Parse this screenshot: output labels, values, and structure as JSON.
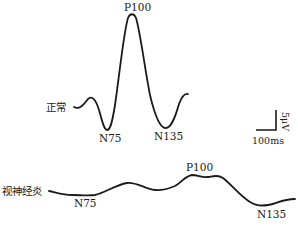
{
  "figure": {
    "type": "VEP waveform comparison",
    "traces": [
      {
        "name": "正常",
        "peaks": [
          {
            "label": "N75",
            "polarity": "negative"
          },
          {
            "label": "P100",
            "polarity": "positive"
          },
          {
            "label": "N135",
            "polarity": "negative"
          }
        ]
      },
      {
        "name": "视神经炎",
        "peaks": [
          {
            "label": "N75",
            "polarity": "negative"
          },
          {
            "label": "P100",
            "polarity": "positive"
          },
          {
            "label": "N135",
            "polarity": "negative"
          }
        ]
      }
    ],
    "scale_bar": {
      "amplitude_label": "5μV",
      "time_label": "100ms"
    }
  }
}
